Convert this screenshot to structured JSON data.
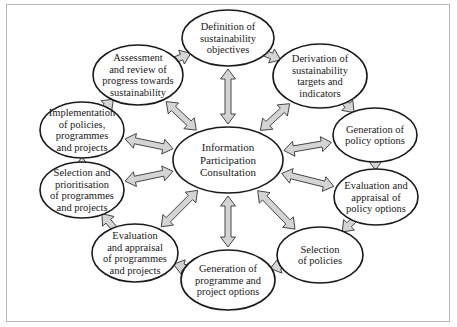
{
  "diagram": {
    "center": {
      "lines": [
        "Information",
        "Participation",
        "Consultation"
      ],
      "cx": 228,
      "cy": 160,
      "rx": 55,
      "ry": 33
    },
    "nodes": [
      {
        "id": "definition",
        "lines": [
          "Definition of",
          "sustainability",
          "objectives"
        ],
        "cx": 228,
        "cy": 38,
        "rx": 46,
        "ry": 28
      },
      {
        "id": "derivation",
        "lines": [
          "Derivation of",
          "sustainability",
          "targets and",
          "indicators"
        ],
        "cx": 320,
        "cy": 76,
        "rx": 47,
        "ry": 32
      },
      {
        "id": "generation-policy",
        "lines": [
          "Generation of",
          "policy options"
        ],
        "cx": 375,
        "cy": 135,
        "rx": 42,
        "ry": 27
      },
      {
        "id": "evaluation-policy",
        "lines": [
          "Evaluation and",
          "appraisal of",
          "policy options"
        ],
        "cx": 376,
        "cy": 197,
        "rx": 42,
        "ry": 28
      },
      {
        "id": "selection-policies",
        "lines": [
          "Selection",
          "of policies"
        ],
        "cx": 320,
        "cy": 255,
        "rx": 43,
        "ry": 28
      },
      {
        "id": "generation-programme",
        "lines": [
          "Generation of",
          "programme and",
          "project options"
        ],
        "cx": 228,
        "cy": 280,
        "rx": 47,
        "ry": 30
      },
      {
        "id": "evaluation-programmes",
        "lines": [
          "Evaluation",
          "and appraisal",
          "of programmes",
          "and projects"
        ],
        "cx": 135,
        "cy": 253,
        "rx": 43,
        "ry": 29
      },
      {
        "id": "selection-prioritisation",
        "lines": [
          "Selection and",
          "prioritisation",
          "of programmes",
          "and projects"
        ],
        "cx": 82,
        "cy": 190,
        "rx": 42,
        "ry": 28
      },
      {
        "id": "implementation",
        "lines": [
          "Implementation",
          "of policies,",
          "programmes",
          "and projects"
        ],
        "cx": 82,
        "cy": 130,
        "rx": 42,
        "ry": 28
      },
      {
        "id": "assessment",
        "lines": [
          "Assessment",
          "and review of",
          "progress towards",
          "sustainability"
        ],
        "cx": 138,
        "cy": 75,
        "rx": 45,
        "ry": 30
      }
    ],
    "cycle_arrow_style": "single-headed, clockwise",
    "spoke_arrow_style": "double-headed, between centre and each node"
  }
}
